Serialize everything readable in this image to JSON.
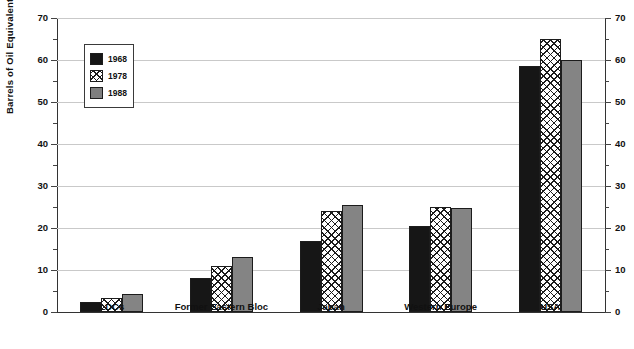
{
  "chart_data": {
    "type": "bar",
    "title": "",
    "subtitle": "",
    "xlabel": "",
    "ylabel": "Barrels of Oil Equivalent",
    "ylabel_right": "",
    "ylim": [
      0,
      70
    ],
    "ytick_step": 10,
    "yminor_step": 5,
    "yticks": [
      0,
      10,
      20,
      30,
      40,
      50,
      60,
      70
    ],
    "ytick_labels": [
      "0",
      "10",
      "20",
      "30",
      "40",
      "50",
      "60",
      "70"
    ],
    "ytick_labels_right": [
      "0",
      "10",
      "20",
      "30",
      "40",
      "50",
      "60",
      "70"
    ],
    "grid": true,
    "grid_axis": "y",
    "dual_axis": true,
    "legend_position": "upper-left-inside",
    "categories": [
      "LDCs",
      "Former Eastern Bloc",
      "Japan",
      "Western Europe",
      "USA"
    ],
    "series": [
      {
        "name": "1968",
        "fill": "solid-black",
        "color": "#161616",
        "values": [
          2.5,
          8.0,
          17.0,
          20.5,
          58.5
        ]
      },
      {
        "name": "1978",
        "fill": "white-crosshatch",
        "color": "#ffffff",
        "values": [
          3.3,
          11.0,
          24.0,
          25.0,
          65.0
        ]
      },
      {
        "name": "1988",
        "fill": "solid-gray",
        "color": "#848484",
        "values": [
          4.3,
          13.0,
          25.5,
          24.8,
          60.0
        ]
      }
    ],
    "annotations": []
  },
  "legend": {
    "items": [
      {
        "label": "1968"
      },
      {
        "label": "1978"
      },
      {
        "label": "1988"
      }
    ]
  },
  "colors": {
    "series_1968": "#161616",
    "series_1978": "#ffffff",
    "series_1988": "#848484",
    "axis": "#333333",
    "gridline": "#c9c9c9",
    "text": "#111111",
    "background": "#ffffff"
  }
}
